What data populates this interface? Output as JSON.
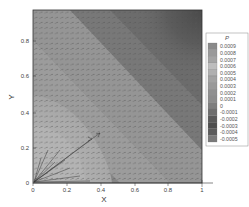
{
  "chart_data": {
    "type": "heatmap",
    "subtype": "filled-contour-with-vector-field",
    "title": "",
    "xlabel": "X",
    "ylabel": "Y",
    "xlim": [
      0,
      1
    ],
    "ylim": [
      0,
      1
    ],
    "xticks": [
      "0",
      "0.2",
      "0.4",
      "0.6",
      "0.8",
      "1"
    ],
    "yticks": [
      "0",
      "0.2",
      "0.4",
      "0.6",
      "0.8"
    ],
    "grid": false,
    "colorbar": {
      "title": "P",
      "position": "right",
      "levels": [
        "0.0009",
        "0.0008",
        "0.0007",
        "0.0006",
        "0.0005",
        "0.0004",
        "0.0003",
        "0.0002",
        "0.0001",
        "0",
        "-0.0001",
        "-0.0002",
        "-0.0003",
        "-0.0004",
        "-0.0005"
      ],
      "colors": [
        "#8a8a8a",
        "#9a9a9a",
        "#a4a4a4",
        "#bdbdbd",
        "#b0b0b0",
        "#a2a2a2",
        "#999999",
        "#909090",
        "#8c8c8c",
        "#7e7e7e",
        "#6e6e6e",
        "#5a5a5a",
        "#4e4e4e",
        "#5c5c5c",
        "#7a7a7a"
      ]
    },
    "regions": [
      {
        "description": "high pressure lobe near origin (bottom-left)",
        "approx_P": 0.0006
      },
      {
        "description": "diagonal band from top-left to bottom-right",
        "approx_P": 0.0002
      },
      {
        "description": "low pressure region near top-right corner",
        "approx_P": -0.0004
      }
    ],
    "vectors": "uniform grid of small velocity arrows; fan of long arrows radiating from origin (0,0) toward upper-right, one long arrow reaching about (0.43, 0.38)"
  }
}
